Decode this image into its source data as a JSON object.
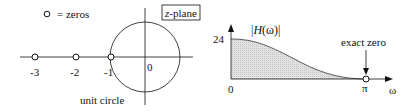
{
  "zplane": {
    "legend_label": "= zeros",
    "box_label": "z-plane",
    "origin_label": "0",
    "circle_label": "unit circle",
    "zeros": [
      {
        "x": -3,
        "label": "-3"
      },
      {
        "x": -2,
        "label": "-2"
      },
      {
        "x": -1,
        "label": "-1"
      }
    ]
  },
  "response": {
    "ylabel": "|H(ω)|",
    "y_tick": "24",
    "x_start": "0",
    "x_end": "π",
    "x_axis": "ω",
    "annotation": "exact zero",
    "fill_color": "#d9d9d9"
  }
}
